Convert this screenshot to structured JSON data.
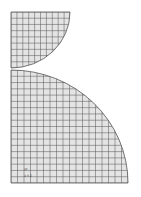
{
  "diagram": {
    "fill_color": "#e4e4e4",
    "line_color": "#555555",
    "top_part": {
      "x": 11,
      "y": 12,
      "w": 59,
      "h": 56,
      "grid_cols": 10,
      "grid_rows": 9
    },
    "bottom_part": {
      "x": 11,
      "y": 70,
      "w": 117,
      "h": 113,
      "grid_cols": 18,
      "grid_rows": 18
    },
    "labels": {
      "axis_label": "yz",
      "coord_label": "X Y Z"
    }
  }
}
